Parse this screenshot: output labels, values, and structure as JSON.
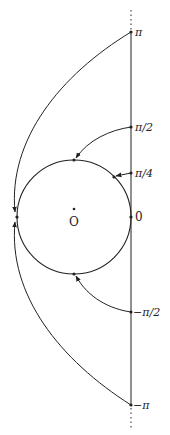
{
  "diagram": {
    "center_label": "O",
    "axis_labels": {
      "pi": "π",
      "pi_half": "π/2",
      "pi_quarter": "π/4",
      "zero": "0",
      "neg_pi_half": "−π/2",
      "neg_pi": "−π"
    },
    "colors": {
      "stroke": "#222222",
      "background": "#ffffff"
    }
  }
}
